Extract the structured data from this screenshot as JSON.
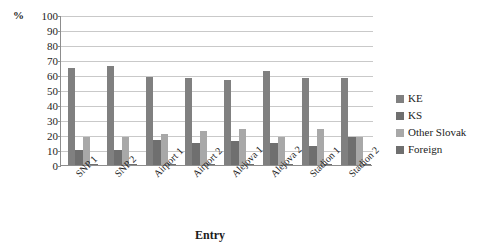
{
  "chart_data": {
    "type": "bar",
    "title": "",
    "subtitle": "",
    "xlabel": "Entry",
    "ylabel": "%",
    "ylim": [
      0,
      100
    ],
    "ytick_step": 10,
    "grid": true,
    "legend_position": "right",
    "categories": [
      "SNP 1",
      "SNP 2",
      "Airport 1",
      "Airport 2",
      "Alejova 1",
      "Alejova 2",
      "Stadion 1",
      "Stadion 2"
    ],
    "yticks": [
      "100",
      "90",
      "80",
      "70",
      "60",
      "50",
      "40",
      "30",
      "20",
      "10",
      "0"
    ],
    "series": [
      {
        "name": "KE",
        "color": "#808080",
        "values": [
          65,
          66,
          59,
          58,
          57,
          63,
          58,
          58
        ]
      },
      {
        "name": "KS",
        "color": "#6f6f6f",
        "values": [
          10,
          10,
          17,
          15,
          16,
          15,
          13,
          19
        ]
      },
      {
        "name": "Other Slovak",
        "color": "#a8a8a8",
        "values": [
          19,
          19,
          21,
          23,
          24,
          19,
          24,
          19
        ]
      },
      {
        "name": "Foreign",
        "color": "#6f6f6f",
        "values": [
          1,
          1,
          1,
          1,
          1,
          1,
          1,
          1
        ]
      }
    ]
  },
  "axis": {
    "y_unit_label": "%",
    "x_title": "Entry"
  },
  "legend": {
    "items": [
      {
        "label": "KE",
        "color": "#808080"
      },
      {
        "label": "KS",
        "color": "#6f6f6f"
      },
      {
        "label": "Other Slovak",
        "color": "#a8a8a8"
      },
      {
        "label": "Foreign",
        "color": "#6f6f6f"
      }
    ]
  },
  "colors": {
    "grid": "#c9c9c9",
    "axis": "#8d8d8d",
    "text": "#1c1c1c",
    "background": "#ffffff"
  }
}
